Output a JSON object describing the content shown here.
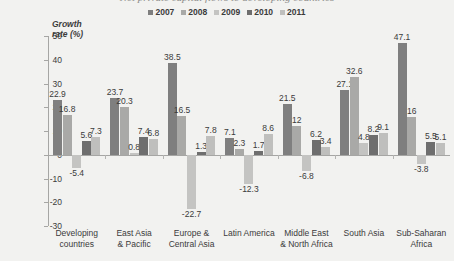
{
  "title_remnant": "Net private capital flows to developing countries",
  "axis_title": "Growth\nrate (%)",
  "legend": {
    "position": "top-center",
    "items": [
      {
        "label": "2007",
        "color": "#7f7f7f"
      },
      {
        "label": "2008",
        "color": "#a9a9a7"
      },
      {
        "label": "2009",
        "color": "#c4c4c2"
      },
      {
        "label": "2010",
        "color": "#6e6e6e"
      },
      {
        "label": "2011",
        "color": "#bfbfbd"
      }
    ]
  },
  "chart_data": {
    "type": "bar",
    "title": "Net private capital flows to developing countries",
    "xlabel": "",
    "ylabel": "Growth rate (%)",
    "ylim": [
      -30,
      50
    ],
    "ytick_step": 10,
    "yticks": [
      50,
      40,
      30,
      20,
      10,
      0,
      -10,
      -20,
      -30
    ],
    "grid": false,
    "legend_position": "top-center",
    "categories": [
      "Developing\ncountries",
      "East Asia\n& Pacific",
      "Europe &\nCentral Asia",
      "Latin America",
      "Middle East\n& North Africa",
      "South Asia",
      "Sub-Saharan\nAfrica"
    ],
    "series": [
      {
        "name": "2007",
        "color": "#7f7f7f",
        "values": [
          22.9,
          23.7,
          38.5,
          7.1,
          21.5,
          27.1,
          47.1
        ]
      },
      {
        "name": "2008",
        "color": "#a9a9a7",
        "values": [
          16.8,
          20.3,
          16.5,
          2.3,
          12.0,
          32.6,
          16.0
        ]
      },
      {
        "name": "2009",
        "color": "#c4c4c2",
        "values": [
          -5.4,
          0.8,
          -22.7,
          -12.3,
          -6.8,
          4.8,
          -3.8
        ]
      },
      {
        "name": "2010",
        "color": "#6e6e6e",
        "values": [
          5.6,
          7.4,
          1.3,
          1.7,
          6.2,
          8.2,
          5.5
        ]
      },
      {
        "name": "2011",
        "color": "#bfbfbd",
        "values": [
          7.3,
          6.8,
          7.8,
          8.6,
          3.4,
          9.1,
          5.1
        ]
      }
    ],
    "value_labels": [
      [
        "22.9",
        "16.8",
        "-5.4",
        "5.6",
        "7.3"
      ],
      [
        "23.7",
        "20.3",
        "0.8",
        "7.4",
        "6.8"
      ],
      [
        "38.5",
        "16.5",
        "-22.7",
        "1.3",
        "7.8"
      ],
      [
        "7.1",
        "2.3",
        "-12.3",
        "1.7",
        "8.6"
      ],
      [
        "21.5",
        "12",
        "-6.8",
        "6.2",
        "3.4"
      ],
      [
        "27.1",
        "32.6",
        "4.8",
        "8.2",
        "9.1"
      ],
      [
        "47.1",
        "16",
        "-3.8",
        "5.5",
        "5.1"
      ]
    ]
  },
  "colors": {
    "background": "#f2f2f0",
    "axis": "#a6a6a4",
    "text": "#3b3b3b"
  }
}
